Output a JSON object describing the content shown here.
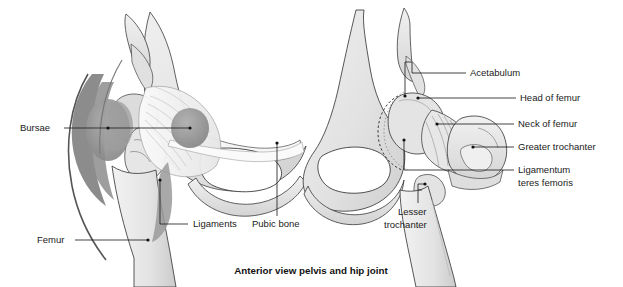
{
  "figure": {
    "title": "Anterior view pelvis and hip joint",
    "background_color": "#ffffff",
    "ink_color": "#1a1a1a",
    "bone_fill": "#e9e9e9",
    "bone_shade": "#d2d2d2",
    "bursa_color": "#9a9a9a",
    "bursa_dark": "#7b7b7b"
  },
  "labels": {
    "bursae": "Bursae",
    "femur": "Femur",
    "ligaments": "Ligaments",
    "pubic_bone": "Pubic bone",
    "acetabulum": "Acetabulum",
    "head_of_femur": "Head of femur",
    "neck_of_femur": "Neck of femur",
    "greater_trochanter": "Greater trochanter",
    "ligamentum_line1": "Ligamentum",
    "ligamentum_line2": "teres femoris",
    "lesser_line1": "Lesser",
    "lesser_line2": "trochanter"
  },
  "panels": {
    "left": "Left view: soft tissue, bursae and ligaments of the hip",
    "right": "Right view: bony anatomy of the hip joint"
  }
}
